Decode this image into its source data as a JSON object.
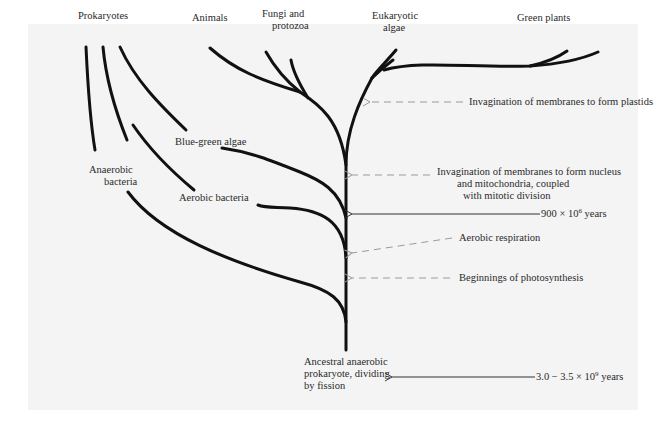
{
  "diagram": {
    "type": "phylogenetic-tree",
    "colors": {
      "background": "#ffffff",
      "panel": "#f4f4f4",
      "branch": "#111111",
      "arrow_dashed": "#9a9a9a",
      "arrow_solid": "#333333",
      "text": "#2a2a2a"
    },
    "leaves": {
      "prokaryotes": "Prokaryotes",
      "animals": "Animals",
      "fungi_line1": "Fungi and",
      "fungi_line2": "protozoa",
      "eukaryotic_line1": "Eukaryotic",
      "eukaryotic_line2": "algae",
      "green_plants": "Green plants",
      "blue_green": "Blue-green algae",
      "anaerobic_line1": "Anaerobic",
      "anaerobic_line2": "bacteria",
      "aerobic": "Aerobic bacteria"
    },
    "root": {
      "line1": "Ancestral anaerobic",
      "line2": "prokaryote, dividing",
      "line3": "by fission"
    },
    "events": {
      "plastids": "Invagination of membranes to form plastids",
      "nucleus_line1": "Invagination of membranes to form nucleus",
      "nucleus_line2": "and mitochondria, coupled",
      "nucleus_line3": "with mitotic division",
      "time_900_base": "900 × 10",
      "time_900_exp": "6",
      "time_900_unit": " years",
      "aerobic_resp": "Aerobic respiration",
      "photosynthesis": "Beginnings of photosynthesis",
      "time_root_base": "3.0 − 3.5 × 10",
      "time_root_exp": "9",
      "time_root_unit": " years"
    }
  }
}
